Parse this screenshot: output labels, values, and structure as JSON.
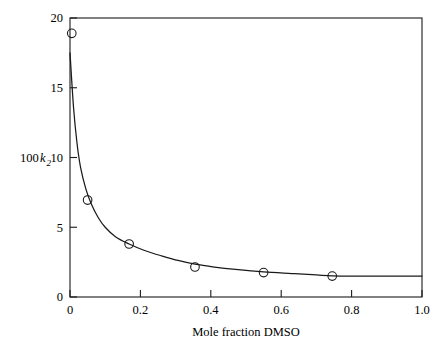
{
  "chart_data": {
    "type": "scatter",
    "title": "",
    "subtitle": "",
    "xlabel": "Mole fraction DMSO",
    "ylabel": "100 k2",
    "ylabel_parts": {
      "prefix": "100",
      "symbol": "k",
      "subscript": "2"
    },
    "xlim": [
      0,
      1.0
    ],
    "ylim": [
      0,
      20
    ],
    "xticks": [
      0,
      0.2,
      0.4,
      0.6,
      0.8,
      1.0
    ],
    "xtick_labels": [
      "0",
      "0.2",
      "0.4",
      "0.6",
      "0.8",
      "1.0"
    ],
    "yticks": [
      0,
      5,
      10,
      15,
      20
    ],
    "ytick_labels": [
      "0",
      "5",
      "10",
      "15",
      "20"
    ],
    "grid": false,
    "legend": null,
    "legend_position": "none",
    "frame": "box",
    "tick_direction": "in",
    "marker": "open-circle",
    "points": [
      {
        "x": 0.005,
        "y": 18.9
      },
      {
        "x": 0.05,
        "y": 6.95
      },
      {
        "x": 0.168,
        "y": 3.8
      },
      {
        "x": 0.355,
        "y": 2.15
      },
      {
        "x": 0.55,
        "y": 1.75
      },
      {
        "x": 0.745,
        "y": 1.5
      }
    ],
    "series": [
      {
        "name": "observed",
        "x": [
          0.005,
          0.05,
          0.168,
          0.355,
          0.55,
          0.745
        ],
        "values": [
          18.9,
          6.95,
          3.8,
          2.15,
          1.75,
          1.5
        ]
      },
      {
        "name": "fitted curve",
        "x": [
          0.0,
          0.01,
          0.02,
          0.03,
          0.045,
          0.06,
          0.08,
          0.1,
          0.13,
          0.168,
          0.21,
          0.26,
          0.31,
          0.355,
          0.41,
          0.47,
          0.55,
          0.63,
          0.7,
          0.745,
          0.8,
          0.87,
          0.94,
          1.0
        ],
        "values": [
          17.5,
          13.6,
          11.0,
          9.3,
          7.75,
          6.7,
          5.7,
          5.0,
          4.3,
          3.8,
          3.35,
          2.95,
          2.6,
          2.35,
          2.15,
          1.98,
          1.8,
          1.68,
          1.58,
          1.52,
          1.5,
          1.5,
          1.5,
          1.5
        ]
      }
    ]
  }
}
